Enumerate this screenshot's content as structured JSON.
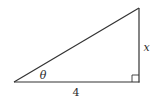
{
  "diagram": {
    "type": "right-triangle",
    "vertices": {
      "left": [
        14,
        82
      ],
      "right_angle": [
        139,
        82
      ],
      "top": [
        139,
        8
      ]
    },
    "right_angle_marker_size": 7,
    "stroke_color": "#333333",
    "labels": {
      "angle": "θ",
      "base": "4",
      "height": "x"
    }
  }
}
